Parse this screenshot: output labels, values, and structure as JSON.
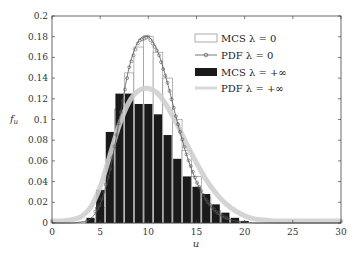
{
  "chart_data": {
    "type": "bar",
    "title": "",
    "xlabel": "u",
    "ylabel": "f_u",
    "xlim": [
      0,
      30
    ],
    "ylim": [
      0,
      0.2
    ],
    "xticks": [
      0,
      5,
      10,
      15,
      20,
      25,
      30
    ],
    "yticks": [
      0,
      0.02,
      0.04,
      0.06,
      0.08,
      0.1,
      0.12,
      0.14,
      0.16,
      0.18,
      0.2
    ],
    "ytick_labels": [
      "0",
      "0.02",
      "0.04",
      "0.06",
      "0.08",
      "0.1",
      "0.12",
      "0.14",
      "0.16",
      "0.18",
      "0.2"
    ],
    "grid": false,
    "legend_position": "upper right",
    "legend": [
      {
        "label": "MCS λ = 0",
        "style": "white-bar"
      },
      {
        "label": "PDF λ = 0",
        "style": "line-circle-markers"
      },
      {
        "label": "MCS λ = +∞",
        "style": "black-bar"
      },
      {
        "label": "PDF λ = +∞",
        "style": "light-gray-thick-line"
      }
    ],
    "series": [
      {
        "name": "MCS λ = 0",
        "type": "bar",
        "color": "#ffffff",
        "edge": "#888888",
        "x": [
          4,
          5,
          6,
          7,
          8,
          9,
          10,
          11,
          12,
          13,
          14,
          15,
          16,
          17,
          18,
          19
        ],
        "values": [
          0.003,
          0.015,
          0.055,
          0.11,
          0.145,
          0.17,
          0.18,
          0.165,
          0.14,
          0.1,
          0.07,
          0.045,
          0.025,
          0.012,
          0.005,
          0.002
        ]
      },
      {
        "name": "PDF λ = 0",
        "type": "line",
        "color": "#555555",
        "marker": "circle",
        "x": [
          0,
          1,
          2,
          3,
          4,
          5,
          6,
          7,
          8,
          9,
          10,
          11,
          12,
          13,
          14,
          15,
          16,
          17,
          18,
          19,
          20,
          21,
          22,
          23,
          24,
          25,
          26,
          27,
          28,
          29,
          30
        ],
        "values": [
          0,
          0,
          0,
          0.001,
          0.004,
          0.018,
          0.05,
          0.1,
          0.15,
          0.176,
          0.18,
          0.165,
          0.135,
          0.098,
          0.065,
          0.04,
          0.022,
          0.011,
          0.005,
          0.002,
          0.001,
          0,
          0,
          0,
          0,
          0,
          0,
          0,
          0,
          0,
          0
        ]
      },
      {
        "name": "MCS λ = +∞",
        "type": "bar",
        "color": "#1a1a1a",
        "x": [
          4,
          5,
          6,
          7,
          8,
          9,
          10,
          11,
          12,
          13,
          14,
          15,
          16,
          17,
          18,
          19,
          20
        ],
        "values": [
          0.005,
          0.032,
          0.088,
          0.125,
          0.125,
          0.115,
          0.115,
          0.105,
          0.085,
          0.062,
          0.045,
          0.035,
          0.028,
          0.018,
          0.01,
          0.005,
          0.002
        ]
      },
      {
        "name": "PDF λ = +∞",
        "type": "line",
        "color": "#cfcfcf",
        "x": [
          0,
          1,
          2,
          3,
          4,
          5,
          6,
          7,
          8,
          9,
          10,
          11,
          12,
          13,
          14,
          15,
          16,
          17,
          18,
          19,
          20,
          21,
          22,
          23,
          24,
          25,
          26,
          27,
          28,
          29,
          30
        ],
        "values": [
          0.002,
          0.002,
          0.003,
          0.006,
          0.015,
          0.035,
          0.065,
          0.095,
          0.117,
          0.128,
          0.13,
          0.125,
          0.112,
          0.095,
          0.076,
          0.058,
          0.042,
          0.029,
          0.019,
          0.012,
          0.007,
          0.004,
          0.003,
          0.002,
          0.002,
          0.002,
          0.002,
          0.002,
          0.002,
          0.002,
          0.002
        ]
      }
    ]
  }
}
